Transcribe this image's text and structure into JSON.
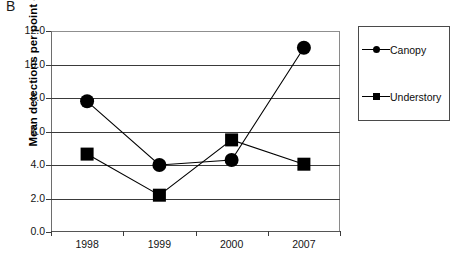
{
  "panel": {
    "label": "B"
  },
  "chart_data": {
    "type": "line",
    "title": "",
    "subtitle": "",
    "xlabel": "",
    "ylabel": "Mean detections per point count",
    "categories": [
      "1998",
      "1999",
      "2000",
      "2007"
    ],
    "series": [
      {
        "name": "Canopy",
        "marker": "circle",
        "values": [
          7.8,
          4.0,
          4.3,
          11.0
        ]
      },
      {
        "name": "Understory",
        "marker": "square",
        "values": [
          4.65,
          2.2,
          5.5,
          4.05
        ]
      }
    ],
    "ylim": [
      0.0,
      12.0
    ],
    "ytick_labels": [
      "0.0",
      "2.0",
      "4.0",
      "6.0",
      "8.0",
      "10.0",
      "12.0"
    ],
    "ytick_values": [
      0.0,
      2.0,
      4.0,
      6.0,
      8.0,
      10.0,
      12.0
    ],
    "grid": true,
    "grid_axis": "y",
    "legend_position": "right-outside",
    "line_color": "#000000",
    "marker_color": "#000000",
    "grid_color": "#3a3a3a"
  },
  "legend": {
    "entries": [
      {
        "label": "Canopy",
        "marker": "circle"
      },
      {
        "label": "Understory",
        "marker": "square"
      }
    ]
  }
}
